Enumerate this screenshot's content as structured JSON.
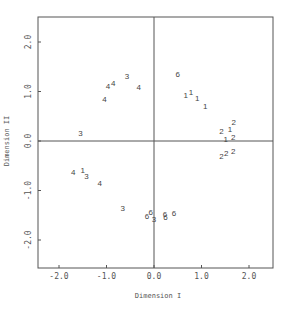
{
  "chart_data": {
    "type": "scatter",
    "title": "",
    "xlabel": "Dimension I",
    "ylabel": "Dimension II",
    "xlim": [
      -2.4,
      2.5
    ],
    "ylim": [
      -2.55,
      2.5
    ],
    "grid": false,
    "legend": null,
    "reference_lines": {
      "x": 0.0,
      "y": 0.0
    },
    "xticks": [
      -2.0,
      -1.0,
      0.0,
      1.0,
      2.0
    ],
    "xtick_labels": [
      "-2.0",
      "-1.0",
      "0.0",
      "1.0",
      "2.0"
    ],
    "yticks": [
      -2.0,
      -1.0,
      0.0,
      1.0,
      2.0
    ],
    "ytick_labels": [
      "-2.0",
      "-1.0",
      "0.0",
      "1.0",
      "2.0"
    ],
    "marker_type": "text labels (group numbers)",
    "points": [
      {
        "label": "3",
        "x": -0.57,
        "y": 1.31
      },
      {
        "label": "4",
        "x": -0.97,
        "y": 1.12
      },
      {
        "label": "4",
        "x": -0.86,
        "y": 1.17
      },
      {
        "label": "4",
        "x": -1.04,
        "y": 0.85
      },
      {
        "label": "4",
        "x": -0.32,
        "y": 1.09
      },
      {
        "label": "3",
        "x": -1.55,
        "y": 0.17
      },
      {
        "label": "6",
        "x": 0.5,
        "y": 1.36
      },
      {
        "label": "1",
        "x": 0.67,
        "y": 0.92
      },
      {
        "label": "1",
        "x": 0.78,
        "y": 0.98
      },
      {
        "label": "1",
        "x": 0.91,
        "y": 0.86
      },
      {
        "label": "1",
        "x": 1.08,
        "y": 0.71
      },
      {
        "label": "2",
        "x": 1.68,
        "y": 0.39
      },
      {
        "label": "1",
        "x": 1.6,
        "y": 0.24
      },
      {
        "label": "2",
        "x": 1.42,
        "y": 0.21
      },
      {
        "label": "1",
        "x": 1.51,
        "y": 0.05
      },
      {
        "label": "2",
        "x": 1.67,
        "y": 0.08
      },
      {
        "label": "2",
        "x": 1.42,
        "y": -0.31
      },
      {
        "label": "2",
        "x": 1.52,
        "y": -0.25
      },
      {
        "label": "2",
        "x": 1.67,
        "y": -0.2
      },
      {
        "label": "4",
        "x": -1.7,
        "y": -0.63
      },
      {
        "label": "1",
        "x": -1.5,
        "y": -0.59
      },
      {
        "label": "3",
        "x": -1.42,
        "y": -0.7
      },
      {
        "label": "4",
        "x": -1.14,
        "y": -0.84
      },
      {
        "label": "3",
        "x": -0.66,
        "y": -1.36
      },
      {
        "label": "6",
        "x": -0.15,
        "y": -1.52
      },
      {
        "label": "6",
        "x": -0.07,
        "y": -1.44
      },
      {
        "label": "3",
        "x": 0.0,
        "y": -1.58
      },
      {
        "label": "6",
        "x": 0.23,
        "y": -1.48
      },
      {
        "label": "6",
        "x": 0.24,
        "y": -1.54
      },
      {
        "label": "6",
        "x": 0.42,
        "y": -1.45
      }
    ]
  }
}
